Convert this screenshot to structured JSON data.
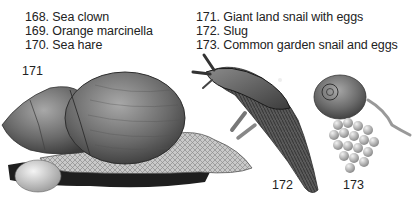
{
  "captions": {
    "left": [
      {
        "number": "168.",
        "label": "Sea clown"
      },
      {
        "number": "169.",
        "label": "Orange marcinella"
      },
      {
        "number": "170.",
        "label": "Sea hare"
      }
    ],
    "right": [
      {
        "number": "171.",
        "label": "Giant land snail with eggs"
      },
      {
        "number": "172.",
        "label": "Slug"
      },
      {
        "number": "173.",
        "label": "Common garden snail and eggs"
      }
    ]
  },
  "caption_lines": {
    "c168": "168. Sea clown",
    "c169": "169. Orange marcinella",
    "c170": "170. Sea hare",
    "c171": "171. Giant land snail with eggs",
    "c172": "172. Slug",
    "c173": "173. Common garden snail and eggs"
  },
  "figure_numbers": {
    "giant_snail": "171",
    "slug": "172",
    "garden_snail": "173"
  },
  "illustrations": [
    {
      "id": "171",
      "subject": "giant-land-snail-with-egg"
    },
    {
      "id": "172",
      "subject": "slug"
    },
    {
      "id": "173",
      "subject": "garden-snail-with-egg-cluster"
    }
  ]
}
